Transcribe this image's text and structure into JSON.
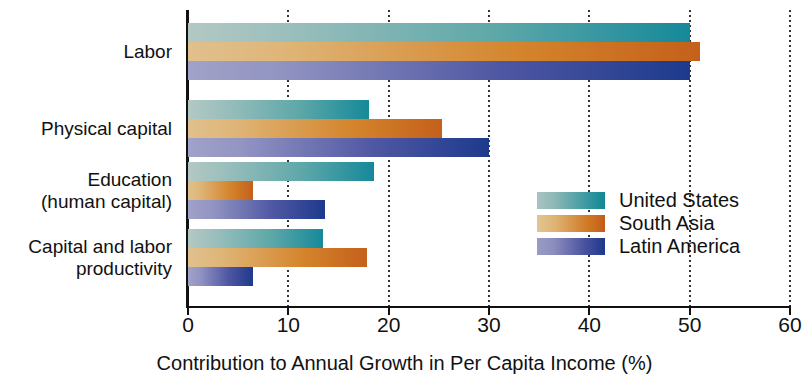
{
  "chart_data": {
    "type": "bar",
    "orientation": "horizontal",
    "title": "",
    "xlabel": "Contribution to Annual Growth in Per Capita Income (%)",
    "ylabel": "",
    "xlim": [
      0,
      60
    ],
    "xticks": [
      0,
      10,
      20,
      30,
      40,
      50,
      60
    ],
    "xticklabels": [
      "0",
      "10",
      "20",
      "30",
      "40",
      "50",
      "60"
    ],
    "grid": "vertical-dotted",
    "legend_position": "center-right",
    "categories": [
      "Labor",
      "Physical capital",
      "Education\n(human capital)",
      "Capital and labor\nproductivity"
    ],
    "series": [
      {
        "name": "United States",
        "key": "us",
        "color": "#15899a",
        "color_light": "#b3c8c4",
        "values": [
          50,
          18,
          18.5,
          13.5
        ]
      },
      {
        "name": "South Asia",
        "key": "sa",
        "color": "#c4601a",
        "color_light": "#e0c08e",
        "values": [
          51,
          25.3,
          6.5,
          17.8
        ]
      },
      {
        "name": "Latin America",
        "key": "la",
        "color": "#1d3a8c",
        "color_light": "#a0a2c8",
        "values": [
          50,
          30,
          13.7,
          6.5
        ]
      }
    ]
  },
  "legend": {
    "items": [
      {
        "label": "United States"
      },
      {
        "label": "South Asia"
      },
      {
        "label": "Latin America"
      }
    ]
  },
  "axis": {
    "x_title": "Contribution to Annual Growth in Per Capita Income (%)"
  }
}
